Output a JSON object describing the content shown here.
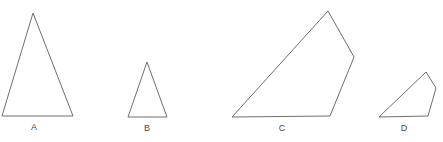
{
  "figure": {
    "width": 443,
    "height": 142,
    "background_color": "#ffffff",
    "stroke_color": "#6e6e6e",
    "label_color": "#4a4a4a",
    "stroke_width": 1,
    "clipped_header_text": "",
    "shapes": [
      {
        "id": "shape-a",
        "label": "A",
        "kind": "triangle",
        "sides": 3,
        "points": "2,116 33,13 73,116 2,116",
        "label_x": 34,
        "label_y": 130
      },
      {
        "id": "shape-b",
        "label": "B",
        "kind": "triangle",
        "sides": 3,
        "points": "128,117 147,62 167,117 128,117",
        "label_x": 147,
        "label_y": 131
      },
      {
        "id": "shape-c",
        "label": "C",
        "kind": "quadrilateral",
        "sides": 4,
        "points": "232,117 328,11 354,57 330,116 232,117",
        "label_x": 282,
        "label_y": 131
      },
      {
        "id": "shape-d",
        "label": "D",
        "kind": "quadrilateral",
        "sides": 4,
        "points": "379,117 426,72 436,88 428,116 379,117",
        "label_x": 404,
        "label_y": 131
      }
    ]
  }
}
